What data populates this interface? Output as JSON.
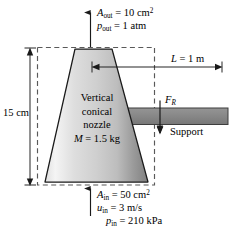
{
  "figure": {
    "nozzle_label_line1": "Vertical",
    "nozzle_label_line2": "conical",
    "nozzle_label_line3": "nozzle",
    "support_label": "Support"
  },
  "outlet": {
    "area_symbol": "A",
    "area_sub": "out",
    "area_value": "= 10 cm",
    "area_exp": "2",
    "pressure_symbol": "p",
    "pressure_sub": "out",
    "pressure_value": "= 1 atm"
  },
  "inlet": {
    "area_symbol": "A",
    "area_sub": "in",
    "area_value": "= 50 cm",
    "area_exp": "2",
    "velocity_symbol": "u",
    "velocity_sub": "in",
    "velocity_value": "= 3 m/s",
    "pressure_symbol": "p",
    "pressure_sub": "in",
    "pressure_value": "= 210 kPa"
  },
  "dimensions": {
    "length_symbol": "L",
    "length_value": "= 1 m",
    "height_value": "15 cm"
  },
  "force": {
    "symbol": "F",
    "sub": "R"
  },
  "mass": {
    "symbol": "M",
    "value": "= 1.5 kg"
  },
  "colors": {
    "outline": "#1a1a1a",
    "dashed_box": "#595959",
    "support_fill": "#8a8a8a",
    "support_stroke": "#3d3d3d",
    "nozzle_light": "#f2f2f2",
    "nozzle_mid": "#d9d9d9",
    "nozzle_dark": "#8c8c8c",
    "background": "#ffffff"
  }
}
